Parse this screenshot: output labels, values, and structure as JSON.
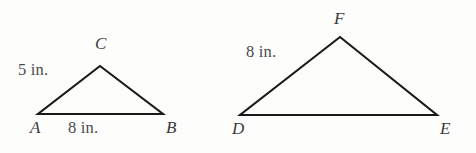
{
  "figure": {
    "background_color": "#fdfdfc",
    "stroke_color": "#1a1a1a",
    "text_color": "#3a3a3c",
    "units": "in.",
    "triangles": [
      {
        "name": "triangle-abc",
        "vertices": [
          {
            "label": "A",
            "x": 38,
            "y": 114
          },
          {
            "label": "B",
            "x": 163,
            "y": 114
          },
          {
            "label": "C",
            "x": 100,
            "y": 66
          }
        ],
        "measures": [
          {
            "side": "AC",
            "text": "5 in.",
            "value": 5
          },
          {
            "side": "AB",
            "text": "8 in.",
            "value": 8
          }
        ]
      },
      {
        "name": "triangle-def",
        "vertices": [
          {
            "label": "D",
            "x": 240,
            "y": 115
          },
          {
            "label": "E",
            "x": 437,
            "y": 115
          },
          {
            "label": "F",
            "x": 340,
            "y": 37
          }
        ],
        "measures": [
          {
            "side": "DF",
            "text": "8 in.",
            "value": 8
          }
        ]
      }
    ],
    "labels": {
      "vertex_a": "A",
      "vertex_b": "B",
      "vertex_c": "C",
      "vertex_d": "D",
      "vertex_e": "E",
      "vertex_f": "F",
      "side_ac_measure": "5 in.",
      "side_ab_measure": "8 in.",
      "side_df_measure": "8 in."
    }
  }
}
